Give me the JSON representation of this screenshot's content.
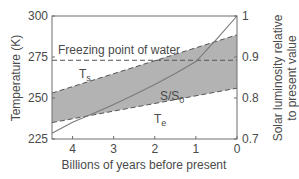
{
  "chart_data": {
    "type": "line",
    "title": "",
    "xlabel": "Billions of years before present",
    "ylabel": "Temperature (K)",
    "y2label_line1": "Solar luminosity relative",
    "y2label_line2": "to present value",
    "xlim": [
      4.5,
      0
    ],
    "ylim": [
      225,
      300
    ],
    "y2lim": [
      0.7,
      1.0
    ],
    "x_ticks": [
      "4",
      "3",
      "2",
      "1",
      "0"
    ],
    "y_ticks": [
      "300",
      "275",
      "250",
      "225"
    ],
    "y2_ticks": [
      "1",
      "0.9",
      "0.8",
      "0.7"
    ],
    "grid": false,
    "series": [
      {
        "name": "Ts",
        "label": "T",
        "label_sub": "s",
        "style": "dashed",
        "axis": "left",
        "x": [
          4.5,
          0
        ],
        "values": [
          253,
          288.5
        ]
      },
      {
        "name": "Te",
        "label": "T",
        "label_sub": "e",
        "style": "dashed",
        "axis": "left",
        "x": [
          4.5,
          0
        ],
        "values": [
          235,
          256
        ]
      },
      {
        "name": "S/S0",
        "label": "S/S",
        "label_sub": "0",
        "style": "solid",
        "axis": "right",
        "x": [
          4.5,
          4,
          3.5,
          3,
          2.5,
          2,
          1.5,
          1,
          0.5,
          0
        ],
        "values": [
          0.714,
          0.741,
          0.762,
          0.784,
          0.808,
          0.833,
          0.86,
          0.889,
          0.943,
          1.0
        ]
      }
    ],
    "shaded_region": {
      "between": [
        "Ts",
        "Te"
      ],
      "color": "#b3b3b3"
    },
    "annotations": [
      {
        "text": "Freezing point of water",
        "y": 273,
        "style": "dashed"
      }
    ]
  },
  "colors": {
    "axis": "#6f6f6f",
    "text": "#4a4a4a",
    "shade": "#b3b3b3",
    "line": "#666666"
  }
}
